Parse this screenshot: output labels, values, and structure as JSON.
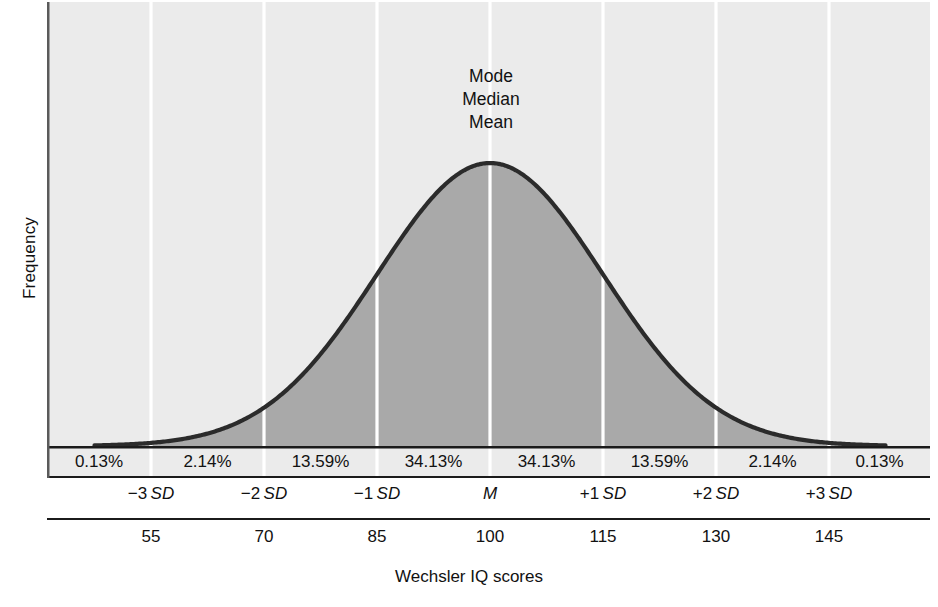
{
  "chart_data": {
    "type": "area",
    "title": "",
    "xlabel": "Wechsler IQ scores",
    "ylabel": "Frequency",
    "distribution": "normal",
    "mean": 100,
    "sd": 15,
    "grid": false,
    "legend_position": "none",
    "center_annotation": [
      "Mode",
      "Median",
      "Mean"
    ],
    "xlim": [
      47.5,
      152.5
    ],
    "ylim": [
      0,
      1
    ],
    "band_percentages": [
      "0.13%",
      "2.14%",
      "13.59%",
      "34.13%",
      "34.13%",
      "13.59%",
      "2.14%",
      "0.13%"
    ],
    "band_values": [
      0.13,
      2.14,
      13.59,
      34.13,
      34.13,
      13.59,
      2.14,
      0.13
    ],
    "band_centers_iq": [
      51.25,
      62.5,
      77.5,
      92.5,
      107.5,
      122.5,
      137.5,
      148.75
    ],
    "sd_ticks": [
      {
        "label_sign": "−3",
        "label_unit": "SD",
        "iq": 55,
        "z": -3
      },
      {
        "label_sign": "−2",
        "label_unit": "SD",
        "iq": 70,
        "z": -2
      },
      {
        "label_sign": "−1",
        "label_unit": "SD",
        "iq": 85,
        "z": -1
      },
      {
        "label_sign": "",
        "label_unit": "M",
        "iq": 100,
        "z": 0
      },
      {
        "label_sign": "+1",
        "label_unit": "SD",
        "iq": 115,
        "z": 1
      },
      {
        "label_sign": "+2",
        "label_unit": "SD",
        "iq": 130,
        "z": 2
      },
      {
        "label_sign": "+3",
        "label_unit": "SD",
        "iq": 145,
        "z": 3
      }
    ],
    "iq_tick_labels": [
      "55",
      "70",
      "85",
      "100",
      "115",
      "130",
      "145"
    ],
    "colors": {
      "background_upper": "#ebebeb",
      "area_fill": "#a9a9a9",
      "curve_stroke": "#2b2b2b",
      "divider": "#ffffff",
      "axis": "#1b1b1b",
      "text": "#111111"
    }
  },
  "axes": {
    "y_title": "Frequency",
    "x_title": "Wechsler IQ scores"
  },
  "annotations": {
    "mode": "Mode",
    "median": "Median",
    "mean": "Mean"
  },
  "bands": [
    {
      "pct": "0.13%"
    },
    {
      "pct": "2.14%"
    },
    {
      "pct": "13.59%"
    },
    {
      "pct": "34.13%"
    },
    {
      "pct": "34.13%"
    },
    {
      "pct": "13.59%"
    },
    {
      "pct": "2.14%"
    },
    {
      "pct": "0.13%"
    }
  ],
  "sd_labels": [
    {
      "text": "−3 SD",
      "sign": "−3",
      "unit": "SD"
    },
    {
      "text": "−2 SD",
      "sign": "−2",
      "unit": "SD"
    },
    {
      "text": "−1 SD",
      "sign": "−1",
      "unit": "SD"
    },
    {
      "text": "M",
      "sign": "",
      "unit": "M"
    },
    {
      "text": "+1 SD",
      "sign": "+1",
      "unit": "SD"
    },
    {
      "text": "+2 SD",
      "sign": "+2",
      "unit": "SD"
    },
    {
      "text": "+3 SD",
      "sign": "+3",
      "unit": "SD"
    }
  ],
  "iq_labels": [
    "55",
    "70",
    "85",
    "100",
    "115",
    "130",
    "145"
  ]
}
